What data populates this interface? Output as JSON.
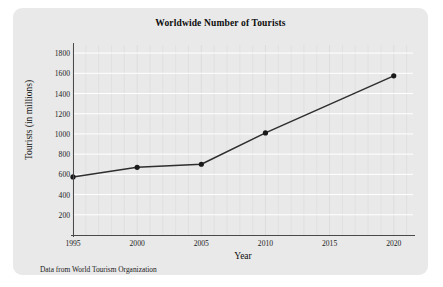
{
  "figure": {
    "panel_color": "#e9e9e9",
    "background_color": "#ffffff"
  },
  "chart_data": {
    "type": "line",
    "title": "Worldwide Number of Tourists",
    "xlabel": "Year",
    "ylabel": "Tourists (in millions)",
    "x": [
      1995,
      2000,
      2005,
      2010,
      2020
    ],
    "values": [
      575,
      670,
      700,
      1010,
      1575
    ],
    "series": [
      {
        "name": "Worldwide tourists",
        "x": [
          1995,
          2000,
          2005,
          2010,
          2020
        ],
        "values": [
          575,
          670,
          700,
          1010,
          1575
        ]
      }
    ],
    "xlim": [
      1995,
      2021.5
    ],
    "ylim": [
      0,
      1880
    ],
    "x_ticks": [
      1995,
      2000,
      2005,
      2010,
      2015,
      2020
    ],
    "x_tick_labels": [
      "1995",
      "2000",
      "2005",
      "2010",
      "2015",
      "2020"
    ],
    "x_minor_tick_step": 1,
    "y_ticks": [
      200,
      400,
      600,
      800,
      1000,
      1200,
      1400,
      1600,
      1800
    ],
    "y_tick_labels": [
      "200",
      "400",
      "600",
      "800",
      "1000",
      "1200",
      "1400",
      "1600",
      "1800"
    ],
    "grid": true,
    "grid_color": "#ffffff",
    "grid_minor_color": "#dcdcdc",
    "legend": null,
    "line_color": "#2e2e2e",
    "marker_color": "#1a1a1a",
    "marker": "circle",
    "annotations": []
  },
  "caption": {
    "source_note": "Data from World Tourism Organization"
  }
}
